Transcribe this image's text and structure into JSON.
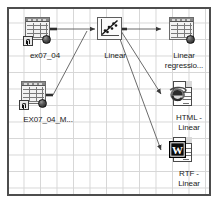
{
  "diagram": {
    "canvas": {
      "background_color": "#ffffff",
      "grid_color": "#d6d6d6",
      "border_color": "#4d4d4d"
    },
    "nodes": [
      {
        "id": "ex07_04",
        "label": "ex07_04",
        "icon": "dataset-spreadsheet-icon",
        "type": "data-source"
      },
      {
        "id": "ex07_04_m",
        "label": "EX07_04_M...",
        "icon": "dataset-spreadsheet-icon",
        "type": "data-source"
      },
      {
        "id": "linear",
        "label": "Linear",
        "icon": "scatter-regression-icon",
        "type": "analysis"
      },
      {
        "id": "linear_regression",
        "label": "Linear\nregressio...",
        "icon": "dataset-spreadsheet-icon",
        "type": "result-table"
      },
      {
        "id": "html_linear",
        "label": "HTML -\nLinear",
        "icon": "html-document-icon",
        "type": "report"
      },
      {
        "id": "rtf_linear",
        "label": "RTF -\nLinear",
        "icon": "rtf-document-icon",
        "type": "report"
      }
    ],
    "edges": [
      {
        "from": "ex07_04",
        "to": "linear"
      },
      {
        "from": "ex07_04_m",
        "to": "linear"
      },
      {
        "from": "linear",
        "to": "linear_regression"
      },
      {
        "from": "linear",
        "to": "html_linear"
      },
      {
        "from": "linear",
        "to": "rtf_linear"
      }
    ]
  }
}
